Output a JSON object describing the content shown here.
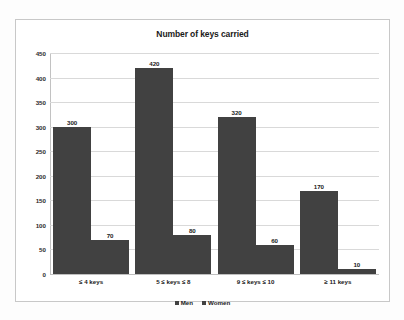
{
  "chart_data": {
    "type": "bar",
    "title": "Number of keys carried",
    "xlabel": "",
    "ylabel": "",
    "ylim": [
      0,
      450
    ],
    "yticks": [
      0,
      50,
      100,
      150,
      200,
      250,
      300,
      350,
      400,
      450
    ],
    "grid": true,
    "legend_position": "bottom",
    "categories": [
      "≤ 4 keys",
      "5 ≤ keys ≤ 8",
      "9 ≤ keys ≤ 10",
      "≥ 11 keys"
    ],
    "series": [
      {
        "name": "Men",
        "values": [
          300,
          420,
          320,
          170
        ],
        "color": "#414141"
      },
      {
        "name": "Women",
        "values": [
          70,
          80,
          60,
          10
        ],
        "color": "#414141"
      }
    ]
  },
  "chart": {
    "title": "Number of keys carried",
    "yticks": [
      {
        "label": "450",
        "value": 450
      },
      {
        "label": "400",
        "value": 400
      },
      {
        "label": "350",
        "value": 350
      },
      {
        "label": "300",
        "value": 300
      },
      {
        "label": "250",
        "value": 250
      },
      {
        "label": "200",
        "value": 200
      },
      {
        "label": "150",
        "value": 150
      },
      {
        "label": "100",
        "value": 100
      },
      {
        "label": "50",
        "value": 50
      },
      {
        "label": "0",
        "value": 0
      }
    ],
    "groups": [
      {
        "category": "≤ 4 keys",
        "bars": [
          {
            "series": "Men",
            "value": 300,
            "label": "300"
          },
          {
            "series": "Women",
            "value": 70,
            "label": "70"
          }
        ]
      },
      {
        "category": "5 ≤ keys ≤ 8",
        "bars": [
          {
            "series": "Men",
            "value": 420,
            "label": "420"
          },
          {
            "series": "Women",
            "value": 80,
            "label": "80"
          }
        ]
      },
      {
        "category": "9 ≤ keys ≤ 10",
        "bars": [
          {
            "series": "Men",
            "value": 320,
            "label": "320"
          },
          {
            "series": "Women",
            "value": 60,
            "label": "60"
          }
        ]
      },
      {
        "category": "≥ 11 keys",
        "bars": [
          {
            "series": "Men",
            "value": 170,
            "label": "170"
          },
          {
            "series": "Women",
            "value": 10,
            "label": "10"
          }
        ]
      }
    ],
    "legend": [
      {
        "label": "Men",
        "color": "#414141"
      },
      {
        "label": "Women",
        "color": "#414141"
      }
    ]
  }
}
